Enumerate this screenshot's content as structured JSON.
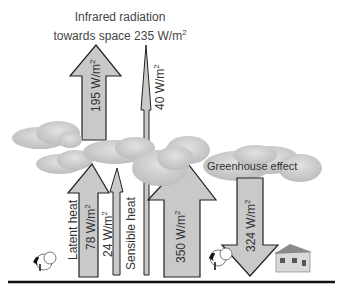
{
  "title": {
    "line1": "Infrared radiation",
    "line2_prefix": "towards space 235 W/m",
    "line2_sup": "2"
  },
  "arrows": [
    {
      "id": "ir-to-space",
      "direction": "up",
      "value_prefix": "195 W/m",
      "sup": "2"
    },
    {
      "id": "atmospheric-window",
      "direction": "up",
      "value_prefix": "40 W/m",
      "sup": "2"
    },
    {
      "id": "latent-heat",
      "direction": "up",
      "value_prefix": "78 W/m",
      "sup": "2",
      "label": "Latent heat"
    },
    {
      "id": "sensible-heat",
      "direction": "up",
      "value_prefix": "24 W/m",
      "sup": "2",
      "label": "Sensible heat"
    },
    {
      "id": "surface-radiation",
      "direction": "up",
      "value_prefix": "350 W/m",
      "sup": "2"
    },
    {
      "id": "back-radiation",
      "direction": "down",
      "value_prefix": "324 W/m",
      "sup": "2"
    }
  ],
  "labels": {
    "greenhouse": "Greenhouse effect"
  },
  "colors": {
    "arrow_fill": "#c9c9c9",
    "arrow_stroke": "#222222",
    "cloud_fill": "#cfcfcf",
    "ground": "#111111"
  }
}
